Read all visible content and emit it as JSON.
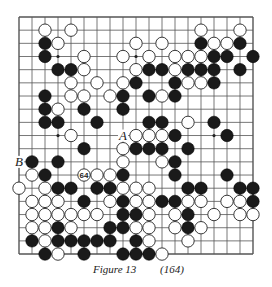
{
  "figure": {
    "title": "Figure 13",
    "number": "(164)"
  },
  "board": {
    "size": 19,
    "origin_x": 19,
    "origin_y": 17,
    "spacing_x": 13,
    "spacing_y": 13.17,
    "stone_radius": 6.2,
    "line_color": "#555555",
    "black_color": "#1a1a1a",
    "white_color": "#ffffff",
    "hoshi": [
      [
        3,
        3
      ],
      [
        3,
        9
      ],
      [
        3,
        15
      ],
      [
        9,
        3
      ],
      [
        9,
        9
      ],
      [
        9,
        15
      ],
      [
        15,
        3
      ],
      [
        15,
        9
      ],
      [
        15,
        15
      ]
    ],
    "rows": [
      "...................",
      "..W.W.........W..W.",
      "..BW.....W.W..BWWB.",
      "..B..W..W.W.WWWBB.B",
      "...BBW...WBBWBBB.B.",
      "....W.W.WB..BWWB...",
      "..B.WW.WB.BWB......",
      "..BW.B..B..........",
      "..BB..B...BB.W.B...",
      "....W....WWWB...B..",
      ".....B..WBBB.B.....",
      ".B.B....W..WB......",
      ".WB..WWWB...B...B..",
      "W.WBB.BBWWW..BB..BB",
      ".WWW.B.WBWWBBWW.WWB",
      ".WWWWWW.BBW.WB.W.WW",
      ".WWBW..BBWW.WBW....",
      ".BWBBBBB.BW..W.....",
      "..BW.B..BBBW......."
    ],
    "move_numbers": [
      {
        "row": 12,
        "col": 5,
        "label": "64",
        "stone": "W"
      }
    ],
    "point_labels": [
      {
        "row": 9,
        "col": 8,
        "label": "A"
      },
      {
        "row": 11,
        "col": 0,
        "label": "B"
      }
    ]
  }
}
